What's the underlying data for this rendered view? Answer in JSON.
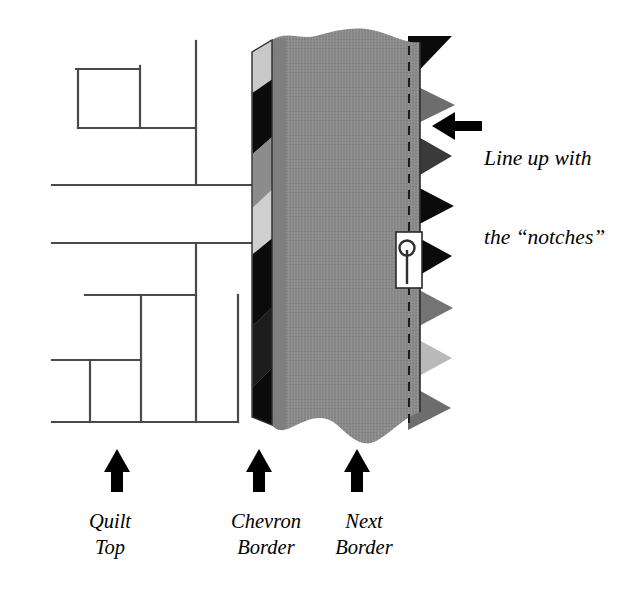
{
  "figure": {
    "background_color": "#ffffff"
  },
  "callout": {
    "line1": "Line up with",
    "line2": "the “notches”",
    "arrow_direction": "left",
    "arrow_color": "#000000"
  },
  "labels": {
    "quilt_top": "Quilt\nTop",
    "chevron_border": "Chevron\nBorder",
    "next_border": "Next\nBorder",
    "arrow_direction": "up",
    "arrow_color": "#000000"
  },
  "palette": {
    "black": "#0b0b0b",
    "dark_gray": "#545454",
    "medium_gray": "#8e8e8e",
    "panel_gray": "#8a8a8a",
    "light_gray": "#c2c2c2",
    "very_light_gray": "#d7d7d7",
    "line_gray": "#5a5a5a",
    "white": "#ffffff"
  },
  "quilt_top": {
    "description": "Pieced quilt top shown as outline seam lines at left",
    "seam_color": "#4a4a4a",
    "seam_width_px": 2
  },
  "chevron_border": {
    "description": "Narrow vertical strip with diagonal bands",
    "x_left": 252,
    "x_right": 272,
    "bands": [
      "light_gray",
      "black",
      "medium_gray",
      "very_light_gray",
      "black",
      "dark_gray"
    ]
  },
  "next_border": {
    "description": "Wide gray panel with torn wavy top and bottom edges",
    "x_left": 272,
    "x_right": 420,
    "fill": "#8a8a8a",
    "seam_line_style": "dashed",
    "seam_line_x": 409
  },
  "notches": {
    "description": "Sawtooth triangular points along right edge",
    "count": 8,
    "colors": [
      "black",
      "medium_gray",
      "dark_gray",
      "black",
      "black",
      "medium_gray",
      "light_gray",
      "medium_gray"
    ]
  },
  "pin": {
    "description": "Straight pin holding the borders together",
    "head_shape": "round",
    "body_color": "#3a3a3a",
    "patch_color": "#ffffff",
    "x": 396,
    "y": 232,
    "width": 26,
    "height": 56
  }
}
